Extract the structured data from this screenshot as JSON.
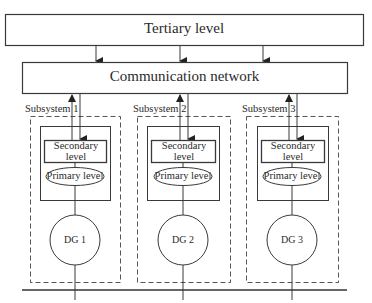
{
  "diagram": {
    "tertiary": {
      "label": "Tertiary level"
    },
    "network": {
      "label": "Communication network"
    },
    "subsystems": [
      {
        "label": "Subsystem 1",
        "secondary": "Secondary level",
        "primary": "Primary level",
        "dg": "DG 1"
      },
      {
        "label": "Subsystem 2",
        "secondary": "Secondary level",
        "primary": "Primary level",
        "dg": "DG 2"
      },
      {
        "label": "Subsystem 3",
        "secondary": "Secondary level",
        "primary": "Primary level",
        "dg": "DG 3"
      }
    ],
    "colors": {
      "line": "#3a3a3a",
      "background": "#ffffff"
    }
  }
}
